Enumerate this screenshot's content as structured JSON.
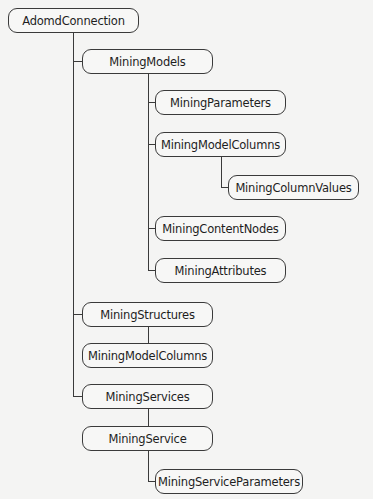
{
  "diagram": {
    "root": "AdomdConnection",
    "nodes": [
      {
        "id": "adomd-connection",
        "label": "AdomdConnection",
        "level": 0,
        "parent": null
      },
      {
        "id": "mining-models",
        "label": "MiningModels",
        "level": 1,
        "parent": "adomd-connection"
      },
      {
        "id": "mining-parameters",
        "label": "MiningParameters",
        "level": 2,
        "parent": "mining-models"
      },
      {
        "id": "mining-model-columns-1",
        "label": "MiningModelColumns",
        "level": 2,
        "parent": "mining-models"
      },
      {
        "id": "mining-column-values",
        "label": "MiningColumnValues",
        "level": 3,
        "parent": "mining-model-columns-1"
      },
      {
        "id": "mining-content-nodes",
        "label": "MiningContentNodes",
        "level": 2,
        "parent": "mining-models"
      },
      {
        "id": "mining-attributes",
        "label": "MiningAttributes",
        "level": 2,
        "parent": "mining-models"
      },
      {
        "id": "mining-structures",
        "label": "MiningStructures",
        "level": 1,
        "parent": "adomd-connection"
      },
      {
        "id": "mining-model-columns-2",
        "label": "MiningModelColumns",
        "level": 1,
        "parent": "mining-structures"
      },
      {
        "id": "mining-services",
        "label": "MiningServices",
        "level": 1,
        "parent": "adomd-connection"
      },
      {
        "id": "mining-service",
        "label": "MiningService",
        "level": 1,
        "parent": "mining-services"
      },
      {
        "id": "mining-service-parameters",
        "label": "MiningServiceParameters",
        "level": 2,
        "parent": "mining-service"
      }
    ]
  },
  "colors": {
    "background": "#f4f4f3",
    "node_fill": "#f7f7f6",
    "stroke": "#3a3a3a",
    "text": "#1e1e1e"
  }
}
